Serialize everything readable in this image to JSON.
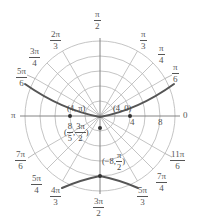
{
  "figure": {
    "type": "polar-graph",
    "pole": {
      "x": 100,
      "y": 116
    },
    "scale_px_per_unit": 7.5,
    "rings": [
      2,
      4,
      6,
      8,
      10
    ],
    "ring_labels": [
      {
        "value": "4",
        "r": 4
      },
      {
        "value": "8",
        "r": 8
      }
    ],
    "curve_color": "#555555",
    "grid_color": "#b0b0b0",
    "angle_labels": [
      {
        "id": "a0",
        "num": "",
        "den": "",
        "text": "0"
      },
      {
        "id": "a30",
        "num": "π",
        "den": "6"
      },
      {
        "id": "a45",
        "num": "π",
        "den": "4"
      },
      {
        "id": "a60",
        "num": "π",
        "den": "3"
      },
      {
        "id": "a90",
        "num": "π",
        "den": "2"
      },
      {
        "id": "a120",
        "num": "2π",
        "den": "3"
      },
      {
        "id": "a135",
        "num": "3π",
        "den": "4"
      },
      {
        "id": "a150",
        "num": "5π",
        "den": "6"
      },
      {
        "id": "a180",
        "text": "π"
      },
      {
        "id": "a210",
        "num": "7π",
        "den": "6"
      },
      {
        "id": "a225",
        "num": "5π",
        "den": "4"
      },
      {
        "id": "a240",
        "num": "4π",
        "den": "3"
      },
      {
        "id": "a270",
        "num": "3π",
        "den": "2"
      },
      {
        "id": "a300",
        "num": "5π",
        "den": "3"
      },
      {
        "id": "a315",
        "num": "7π",
        "den": "4"
      },
      {
        "id": "a330",
        "num": "11π",
        "den": "6"
      }
    ],
    "points": [
      {
        "label": "(4, π)",
        "r": 4,
        "theta_deg": 180
      },
      {
        "label": "(4, 0)",
        "r": 4,
        "theta_deg": 0
      },
      {
        "label_pre": "(",
        "num": "8",
        "den": "5",
        "sep": ",",
        "num2": "3π",
        "den2": "2",
        "label_post": ")",
        "r": 1.6,
        "theta_deg": 270
      },
      {
        "label_pre": "(−8, ",
        "num": "π",
        "den": "2",
        "label_post": ")",
        "r": -8,
        "theta_deg": 90
      }
    ]
  }
}
